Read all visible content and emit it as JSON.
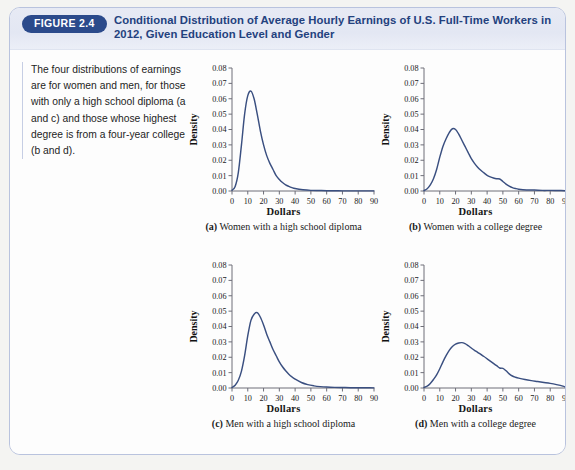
{
  "figure": {
    "badge": "FIGURE 2.4",
    "title": "Conditional Distribution of Average Hourly Earnings of U.S. Full-Time Workers in 2012, Given Education Level and Gender",
    "caption": "The four distributions of earnings are for women and men, for those with only a high school diploma (a and c) and those whose highest degree is from a four-year college (b and d).",
    "accent_color": "#2b4a8b",
    "title_color": "#23417e",
    "curve_color": "#3a4f80",
    "border_color": "#b9c3de"
  },
  "chart_data": [
    {
      "type": "line",
      "key": "a",
      "title": "Women with a high school diploma",
      "caption_label": "(a)",
      "xlabel": "Dollars",
      "ylabel": "Density",
      "xlim": [
        0,
        90
      ],
      "ylim": [
        0,
        0.08
      ],
      "xticks": [
        0,
        10,
        20,
        30,
        40,
        50,
        60,
        70,
        80,
        90
      ],
      "yticks": [
        "0.00",
        "0.01",
        "0.02",
        "0.03",
        "0.04",
        "0.05",
        "0.06",
        "0.07",
        "0.08"
      ],
      "grid": false,
      "legend": "none",
      "peak_x": 12,
      "peak_y": 0.065,
      "x": [
        0,
        2,
        4,
        6,
        8,
        10,
        12,
        14,
        16,
        18,
        20,
        22,
        24,
        26,
        28,
        30,
        32,
        34,
        36,
        38,
        40,
        45,
        50,
        55,
        60,
        65,
        70,
        75,
        80,
        85,
        90
      ],
      "y": [
        0.0005,
        0.003,
        0.012,
        0.03,
        0.05,
        0.062,
        0.065,
        0.06,
        0.05,
        0.039,
        0.03,
        0.023,
        0.018,
        0.014,
        0.01,
        0.0075,
        0.0055,
        0.004,
        0.003,
        0.0022,
        0.0016,
        0.0008,
        0.0004,
        0.0003,
        0.0002,
        0.0002,
        0.0001,
        0.0001,
        0.0001,
        0.0001,
        0.0001
      ]
    },
    {
      "type": "line",
      "key": "b",
      "title": "Women with a college degree",
      "caption_label": "(b)",
      "xlabel": "Dollars",
      "ylabel": "Density",
      "xlim": [
        0,
        90
      ],
      "ylim": [
        0,
        0.08
      ],
      "xticks": [
        0,
        10,
        20,
        30,
        40,
        50,
        60,
        70,
        80,
        90
      ],
      "yticks": [
        "0.00",
        "0.01",
        "0.02",
        "0.03",
        "0.04",
        "0.05",
        "0.06",
        "0.07",
        "0.08"
      ],
      "grid": false,
      "legend": "none",
      "peak_x": 18,
      "peak_y": 0.0405,
      "x": [
        0,
        2,
        4,
        6,
        8,
        10,
        12,
        14,
        16,
        18,
        20,
        22,
        24,
        26,
        28,
        30,
        32,
        34,
        36,
        38,
        40,
        42,
        44,
        46,
        48,
        50,
        52,
        54,
        56,
        58,
        60,
        65,
        70,
        75,
        80,
        85,
        90
      ],
      "y": [
        0.0003,
        0.0015,
        0.004,
        0.008,
        0.014,
        0.022,
        0.029,
        0.034,
        0.038,
        0.0405,
        0.04,
        0.037,
        0.033,
        0.029,
        0.025,
        0.021,
        0.018,
        0.0155,
        0.0135,
        0.0118,
        0.0102,
        0.0092,
        0.0085,
        0.008,
        0.0078,
        0.0062,
        0.0045,
        0.0032,
        0.0022,
        0.0016,
        0.0012,
        0.0007,
        0.0006,
        0.0004,
        0.0004,
        0.0003,
        0.0002
      ]
    },
    {
      "type": "line",
      "key": "c",
      "title": "Men with a high school diploma",
      "caption_label": "(c)",
      "xlabel": "Dollars",
      "ylabel": "Density",
      "xlim": [
        0,
        90
      ],
      "ylim": [
        0,
        0.08
      ],
      "xticks": [
        0,
        10,
        20,
        30,
        40,
        50,
        60,
        70,
        80,
        90
      ],
      "yticks": [
        "0.00",
        "0.01",
        "0.02",
        "0.03",
        "0.04",
        "0.05",
        "0.06",
        "0.07",
        "0.08"
      ],
      "grid": false,
      "legend": "none",
      "peak_x": 16,
      "peak_y": 0.049,
      "x": [
        0,
        2,
        4,
        6,
        8,
        10,
        12,
        14,
        16,
        18,
        20,
        22,
        24,
        26,
        28,
        30,
        32,
        34,
        36,
        38,
        40,
        44,
        48,
        52,
        56,
        60,
        65,
        70,
        75,
        80,
        85,
        90
      ],
      "y": [
        0.0003,
        0.0018,
        0.005,
        0.011,
        0.021,
        0.034,
        0.044,
        0.048,
        0.049,
        0.046,
        0.041,
        0.035,
        0.03,
        0.025,
        0.021,
        0.017,
        0.0138,
        0.0112,
        0.009,
        0.0072,
        0.0058,
        0.0036,
        0.0022,
        0.0014,
        0.0009,
        0.0006,
        0.0004,
        0.0003,
        0.0002,
        0.0002,
        0.0002,
        0.0001
      ]
    },
    {
      "type": "line",
      "key": "d",
      "title": "Men with a college degree",
      "caption_label": "(d)",
      "xlabel": "Dollars",
      "ylabel": "Density",
      "xlim": [
        0,
        90
      ],
      "ylim": [
        0,
        0.08
      ],
      "xticks": [
        0,
        10,
        20,
        30,
        40,
        50,
        60,
        70,
        80,
        90
      ],
      "yticks": [
        "0.00",
        "0.01",
        "0.02",
        "0.03",
        "0.04",
        "0.05",
        "0.06",
        "0.07",
        "0.08"
      ],
      "grid": false,
      "legend": "none",
      "peak_x": 23,
      "peak_y": 0.0295,
      "x": [
        0,
        2,
        4,
        6,
        8,
        10,
        12,
        14,
        16,
        18,
        20,
        22,
        24,
        26,
        28,
        30,
        32,
        34,
        36,
        38,
        40,
        42,
        44,
        46,
        48,
        50,
        52,
        54,
        56,
        58,
        60,
        64,
        68,
        72,
        76,
        80,
        84,
        88,
        90
      ],
      "y": [
        0.0004,
        0.0012,
        0.003,
        0.0055,
        0.0085,
        0.0125,
        0.017,
        0.021,
        0.0245,
        0.027,
        0.0285,
        0.0293,
        0.0295,
        0.0288,
        0.0275,
        0.026,
        0.0245,
        0.0232,
        0.0218,
        0.0205,
        0.019,
        0.0175,
        0.016,
        0.0145,
        0.013,
        0.0128,
        0.0112,
        0.0092,
        0.0078,
        0.007,
        0.0064,
        0.0055,
        0.0048,
        0.0042,
        0.0036,
        0.003,
        0.0022,
        0.0012,
        0.0004
      ]
    }
  ]
}
